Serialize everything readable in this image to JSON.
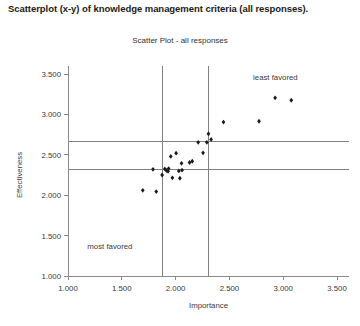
{
  "caption": "Scatterplot (x-y) of knowledge management criteria (all responses).",
  "chart_data": {
    "type": "scatter",
    "title": "Scatter Plot - all responses",
    "xlabel": "Importance",
    "ylabel": "Effectiveness",
    "xlim": [
      1.0,
      3.5
    ],
    "ylim": [
      1.0,
      3.5
    ],
    "xticks": [
      "1.000",
      "1.500",
      "2.000",
      "2.500",
      "3.000",
      "3.500"
    ],
    "yticks": [
      "1.000",
      "1.500",
      "2.000",
      "2.500",
      "3.000",
      "3.500"
    ],
    "xtick_values": [
      1.0,
      1.5,
      2.0,
      2.5,
      3.0,
      3.5
    ],
    "ytick_values": [
      1.0,
      1.5,
      2.0,
      2.5,
      3.0,
      3.5
    ],
    "grid": false,
    "legend": "none",
    "marker": "filled-diamond",
    "marker_color": "#1a1a1a",
    "reference_lines": {
      "vertical": [
        1.875,
        2.31
      ],
      "horizontal": [
        2.665,
        2.32
      ],
      "color": "#808080"
    },
    "annotations": [
      {
        "text": "least favored",
        "x": 2.72,
        "y": 3.42
      },
      {
        "text": "most favored",
        "x": 1.18,
        "y": 1.33
      }
    ],
    "points": [
      {
        "x": 1.695,
        "y": 2.06
      },
      {
        "x": 1.82,
        "y": 2.045
      },
      {
        "x": 1.79,
        "y": 2.32
      },
      {
        "x": 1.875,
        "y": 2.25
      },
      {
        "x": 1.9,
        "y": 2.325
      },
      {
        "x": 1.915,
        "y": 2.305
      },
      {
        "x": 1.93,
        "y": 2.295
      },
      {
        "x": 1.935,
        "y": 2.33
      },
      {
        "x": 1.955,
        "y": 2.48
      },
      {
        "x": 1.97,
        "y": 2.215
      },
      {
        "x": 2.005,
        "y": 2.52
      },
      {
        "x": 2.03,
        "y": 2.3
      },
      {
        "x": 2.04,
        "y": 2.21
      },
      {
        "x": 2.055,
        "y": 2.395
      },
      {
        "x": 2.06,
        "y": 2.31
      },
      {
        "x": 2.13,
        "y": 2.405
      },
      {
        "x": 2.155,
        "y": 2.42
      },
      {
        "x": 2.21,
        "y": 2.655
      },
      {
        "x": 2.255,
        "y": 2.525
      },
      {
        "x": 2.29,
        "y": 2.655
      },
      {
        "x": 2.305,
        "y": 2.76
      },
      {
        "x": 2.33,
        "y": 2.69
      },
      {
        "x": 2.445,
        "y": 2.905
      },
      {
        "x": 2.775,
        "y": 2.915
      },
      {
        "x": 2.925,
        "y": 3.205
      },
      {
        "x": 3.075,
        "y": 3.175
      }
    ]
  }
}
